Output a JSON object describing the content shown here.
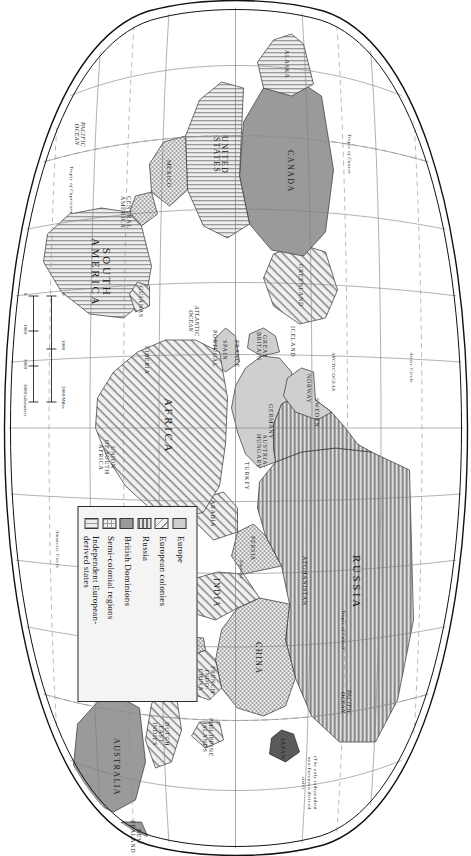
{
  "map": {
    "legend": {
      "entries": [
        {
          "swatch": "solid-light-gray",
          "label": "Europe"
        },
        {
          "swatch": "diagonal-hatch",
          "label": "European colonies"
        },
        {
          "swatch": "horizontal-lines",
          "label": "Russia"
        },
        {
          "swatch": "solid-dark-gray",
          "label": "British Dominions"
        },
        {
          "swatch": "checkerboard",
          "label": "Semi-colonial regions"
        },
        {
          "swatch": "vertical-lines",
          "label": "Independent European-\nderived states"
        }
      ]
    },
    "scale": {
      "miles_ticks": [
        "0",
        "1000",
        "2000 Miles"
      ],
      "kilometers_ticks": [
        "0",
        "1000",
        "2000",
        "3000 kilometers"
      ]
    },
    "annotation": {
      "japan_note": "(The only independent\nnon-European derived\nstate)"
    },
    "continents": [
      {
        "name": "RUSSIA",
        "fill": "russia"
      },
      {
        "name": "CHINA",
        "fill": "semi"
      },
      {
        "name": "INDIA",
        "fill": "colony"
      },
      {
        "name": "AFRICA",
        "fill": "colony"
      },
      {
        "name": "SOUTH\nAMERICA",
        "fill": "indep"
      },
      {
        "name": "CANADA",
        "fill": "dominion"
      },
      {
        "name": "UNITED\nSTATES",
        "fill": "indep"
      },
      {
        "name": "AUSTRALIA",
        "fill": "dominion"
      }
    ],
    "labels": {
      "canada": "CANADA",
      "united_states": "UNITED\nSTATES",
      "alaska": "ALASKA",
      "mexico": "MEXICO",
      "central_america": "CENTRAL\nAMERICA",
      "south_america": "SOUTH\nAMERICA",
      "guianas": "GUIANAS",
      "greenland": "GREENLAND",
      "iceland": "ICELAND",
      "norway": "NORWAY",
      "sweden": "SWEDEN",
      "great_britain": "GREAT\nBRITAIN",
      "france": "FRANCE",
      "spain": "SPAIN",
      "portugal": "PORTUGAL",
      "germany": "GERMANY",
      "austria_hungary": "AUSTRIA-\nHUNGARY",
      "turkey": "TURKEY",
      "arabia": "ARABIA",
      "persia": "PERSIA",
      "afghanistan": "AFGHANISTAN",
      "russia": "RUSSIA",
      "china": "CHINA",
      "india": "INDIA",
      "siam": "SIAM",
      "japan": "JAPAN",
      "french_indo_china": "FRENCH\nINDO-\nCHINA",
      "philippine_islands": "PHILIPPINE\nISLANDS",
      "dutch_east_indies": "DUTCH\nEAST\nINDIES",
      "australia": "AUSTRALIA",
      "new_zealand": "NEW\nZEALAND",
      "africa": "AFRICA",
      "madagascar": "MADAGASCAR",
      "liberia": "LIBERIA",
      "union_of_south_africa": "UNION\nOF SOUTH\nAFRICA"
    },
    "oceans": {
      "pacific_west": "PACIFIC\nOCEAN",
      "pacific_east": "PACIFIC\nOCEAN",
      "atlantic": "ATLANTIC\nOCEAN",
      "indian": "INDIAN\nOCEAN",
      "arctic": "ARCTIC OCEAN"
    },
    "graticule": {
      "tropic_of_cancer": "Tropic of Cancer",
      "tropic_of_capricorn": "Tropic of Capricorn",
      "equator": "Equator",
      "arctic_circle": "Arctic Circle",
      "antarctic_circle": "Antarctic Circle",
      "meridians": [
        "180°",
        "150°",
        "120°",
        "90°",
        "60°",
        "30°",
        "0°",
        "30°",
        "60°",
        "90°",
        "120°",
        "150°",
        "180°"
      ],
      "parallels": [
        "60°",
        "30°",
        "0°",
        "30°",
        "60°"
      ]
    }
  }
}
